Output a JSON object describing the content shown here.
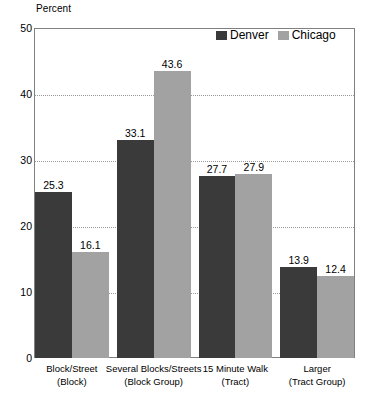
{
  "chart_data": {
    "type": "bar",
    "title": "",
    "subtitle": "",
    "xlabel": "",
    "ylabel": "Percent",
    "ylim": [
      0,
      50
    ],
    "yticks": [
      0,
      10,
      20,
      30,
      40,
      50
    ],
    "grid": true,
    "gridlines_at": [
      10,
      20,
      30,
      40
    ],
    "legend_position": "top-right",
    "categories": [
      "Block/Street (Block)",
      "Several Blocks/Streets (Block Group)",
      "15 Minute Walk (Tract)",
      "Larger (Tract Group)"
    ],
    "category_lines": [
      {
        "line1": "Block/Street",
        "line2": "(Block)"
      },
      {
        "line1": "Several Blocks/Streets",
        "line2": "(Block Group)"
      },
      {
        "line1": "15 Minute Walk",
        "line2": "(Tract)"
      },
      {
        "line1": "Larger",
        "line2": "(Tract Group)"
      }
    ],
    "series": [
      {
        "name": "Denver",
        "color": "#3a3a3a",
        "values": [
          25.3,
          33.1,
          27.7,
          13.9
        ]
      },
      {
        "name": "Chicago",
        "color": "#a2a2a2",
        "values": [
          16.1,
          43.6,
          27.9,
          12.4
        ]
      }
    ],
    "value_labels": {
      "denver": [
        "25.3",
        "33.1",
        "27.7",
        "13.9"
      ],
      "chicago": [
        "16.1",
        "43.6",
        "27.9",
        "12.4"
      ]
    },
    "ytick_labels": [
      "0",
      "10",
      "20",
      "30",
      "40",
      "50"
    ]
  }
}
